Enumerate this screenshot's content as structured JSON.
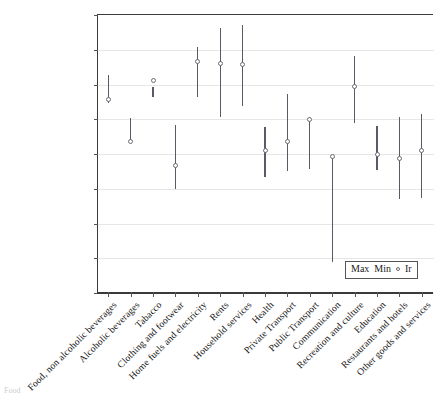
{
  "chart_data": {
    "type": "scatter",
    "title": "",
    "subtitle": "",
    "xlabel": "",
    "ylabel": "",
    "ylim": [
      -1.6,
      0.0
    ],
    "ytick_step": 0.2,
    "grid": true,
    "legend_position": "inside-bottom-right",
    "legend": [
      "Max",
      "Min",
      "Ir"
    ],
    "legend_marker_icon": "open-circle",
    "categories": [
      "Food, non alcoholic beverages",
      "Alcoholic beverages",
      "Tabacco",
      "Clothing and footwear",
      "Home fuels and electricity",
      "Rents",
      "Household services",
      "Health",
      "Private Transport",
      "Public Transport",
      "Communication",
      "Recreation and culture",
      "Education",
      "Restaurants and hotels",
      "Other goods and services"
    ],
    "series": [
      {
        "name": "Max",
        "values": [
          -0.35,
          -0.6,
          -0.42,
          -0.64,
          -0.19,
          -0.08,
          -0.065,
          -0.65,
          -0.46,
          -0.59,
          -0.82,
          -0.24,
          -0.645,
          -0.595,
          -0.575
        ]
      },
      {
        "name": "Min",
        "values": [
          -0.51,
          -0.745,
          -0.48,
          -1.01,
          -0.475,
          -0.59,
          -0.53,
          -0.94,
          -0.905,
          -0.89,
          -1.425,
          -0.63,
          -0.895,
          -1.065,
          -1.06
        ]
      },
      {
        "name": "Ir",
        "values": [
          -0.49,
          -0.735,
          -0.38,
          -0.87,
          -0.275,
          -0.285,
          -0.29,
          -0.785,
          -0.735,
          -0.605,
          -0.82,
          -0.415,
          -0.81,
          -0.83,
          -0.785
        ]
      }
    ],
    "ytick_labels": [
      "0.000",
      "-0.200",
      "-0.400",
      "-0.600",
      "-0.800",
      "-1.000",
      "-1.200",
      "-1.400",
      "-1.600"
    ],
    "ytick_values": [
      0.0,
      -0.2,
      -0.4,
      -0.6,
      -0.8,
      -1.0,
      -1.2,
      -1.4,
      -1.6
    ]
  },
  "footnote": "Food"
}
